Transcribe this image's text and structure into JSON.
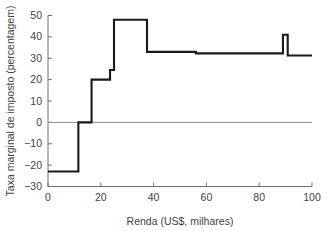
{
  "chart_data": {
    "type": "line",
    "subtype": "step",
    "title": "",
    "xlabel": "Renda (US$, milhares)",
    "ylabel": "Taxa marginal de imposto (percentagem)",
    "xlim": [
      0,
      100
    ],
    "ylim": [
      -30,
      50
    ],
    "xticks": [
      0,
      20,
      40,
      60,
      80,
      100
    ],
    "xtick_labels": [
      "0",
      "20",
      "40",
      "60",
      "80",
      "100"
    ],
    "yticks": [
      -30,
      -20,
      -10,
      0,
      10,
      20,
      30,
      40,
      50
    ],
    "ytick_labels": [
      "−30",
      "−20",
      "−10",
      "0",
      "10",
      "20",
      "30",
      "40",
      "50"
    ],
    "grid": false,
    "legend": null,
    "zero_reference_line": 0,
    "line_color": "#1a1a1a",
    "axis_color": "#6e6e6e",
    "text_color": "#3f3f3f",
    "series": [
      {
        "name": "Taxa marginal de imposto",
        "step_segments": [
          {
            "x_start": 0.0,
            "x_end": 11.5,
            "y": -23.0
          },
          {
            "x_start": 11.5,
            "x_end": 16.5,
            "y": 0.0
          },
          {
            "x_start": 16.5,
            "x_end": 23.5,
            "y": 20.0
          },
          {
            "x_start": 23.5,
            "x_end": 25.0,
            "y": 24.5
          },
          {
            "x_start": 25.0,
            "x_end": 37.5,
            "y": 48.0
          },
          {
            "x_start": 37.5,
            "x_end": 56.0,
            "y": 33.0
          },
          {
            "x_start": 56.0,
            "x_end": 89.0,
            "y": 32.3
          },
          {
            "x_start": 89.0,
            "x_end": 90.8,
            "y": 41.0
          },
          {
            "x_start": 90.8,
            "x_end": 100.0,
            "y": 31.3
          }
        ]
      }
    ]
  }
}
